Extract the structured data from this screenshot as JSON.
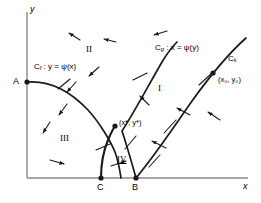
{
  "figure": {
    "background_color": "#ffffff",
    "stroke_color": "#1a1a1a",
    "axis_color": "#808080"
  },
  "axes": {
    "x_label": "x",
    "y_label": "y",
    "origin": {
      "x": 27,
      "y": 178
    },
    "x_end": {
      "x": 248,
      "y": 178
    },
    "y_top": {
      "x": 27,
      "y": 12
    }
  },
  "points": [
    {
      "name": "A",
      "label": "A",
      "x": 27,
      "y": 82,
      "label_x": 13,
      "label_y": 77,
      "filled": true
    },
    {
      "name": "C",
      "label": "C",
      "x": 101,
      "y": 178,
      "label_x": 97,
      "label_y": 183,
      "filled": true
    },
    {
      "name": "B",
      "label": "B",
      "x": 136,
      "y": 178,
      "label_x": 132,
      "label_y": 183,
      "filled": true
    },
    {
      "name": "x0y0",
      "label": "(x₀, y₀)",
      "x": 213,
      "y": 73,
      "label_x": 218,
      "label_y": 76,
      "filled": true
    },
    {
      "name": "xstar-ystar",
      "label": "(x*, y*)",
      "x": 115,
      "y": 126,
      "label_x": 119,
      "label_y": 119,
      "filled": true
    }
  ],
  "curves": [
    {
      "name": "curve-cf",
      "id": "Cf",
      "label_prefix": "C",
      "label_subscript": "f",
      "label_rest": " : y = ψ(x)",
      "label_full": "Cᶠ : y = ψ(x)",
      "label_x": 34,
      "label_y": 63,
      "path": "M 27 82 C 52 80 72 93 88 110 C 99 122 110 140 115 152 C 119 163 120 172 121 178"
    },
    {
      "name": "curve-cg",
      "id": "Cg",
      "label_prefix": "C",
      "label_subscript": "g",
      "label_rest": " : x = ψ(y)",
      "label_full": "Cᵍ : x = ψ(y)",
      "label_x": 155,
      "label_y": 44,
      "path": "M 136 178 C 131 160 126 143 122 131 C 132 116 147 88 162 62 C 168 52 173 46 177 42"
    },
    {
      "name": "curve-ck",
      "id": "Ck",
      "label_prefix": "C",
      "label_subscript": "k",
      "label_rest": "",
      "label_full": "Cᵏ",
      "label_x": 228,
      "label_y": 55,
      "path": "M 136 178 C 153 158 172 130 192 101 C 210 76 228 54 246 38"
    }
  ],
  "segment_cb": {
    "name": "segment-c-to-branch",
    "path": "M 101 178 C 101 168 103 152 108 140 C 111 133 113 129 115 126"
  },
  "regions": [
    {
      "name": "region-one",
      "label": "I",
      "x": 158,
      "y": 84,
      "underlined": false
    },
    {
      "name": "region-two",
      "label": "II",
      "x": 86,
      "y": 45,
      "underlined": false
    },
    {
      "name": "region-three",
      "label": "III",
      "x": 60,
      "y": 134,
      "underlined": false
    },
    {
      "name": "region-four",
      "label": "IV",
      "x": 117,
      "y": 155,
      "underlined": true
    }
  ],
  "field_arrows": [
    {
      "name": "arrow-field",
      "x1": 80,
      "y1": 40,
      "x2": 69,
      "y2": 33
    },
    {
      "name": "arrow-field",
      "x1": 116,
      "y1": 42,
      "x2": 104,
      "y2": 39
    },
    {
      "name": "arrow-field",
      "x1": 167,
      "y1": 31,
      "x2": 154,
      "y2": 35
    },
    {
      "name": "arrow-field",
      "x1": 99,
      "y1": 67,
      "x2": 89,
      "y2": 76
    },
    {
      "name": "arrow-field",
      "x1": 76,
      "y1": 82,
      "x2": 67,
      "y2": 92
    },
    {
      "name": "arrow-field",
      "x1": 67,
      "y1": 104,
      "x2": 59,
      "y2": 115
    },
    {
      "name": "arrow-field",
      "x1": 50,
      "y1": 122,
      "x2": 43,
      "y2": 133
    },
    {
      "name": "arrow-field",
      "x1": 50,
      "y1": 160,
      "x2": 64,
      "y2": 164
    },
    {
      "name": "arrow-field",
      "x1": 111,
      "y1": 166,
      "x2": 126,
      "y2": 161
    },
    {
      "name": "arrow-field",
      "x1": 149,
      "y1": 105,
      "x2": 140,
      "y2": 96
    },
    {
      "name": "arrow-field",
      "x1": 190,
      "y1": 115,
      "x2": 177,
      "y2": 108
    },
    {
      "name": "arrow-field",
      "x1": 166,
      "y1": 148,
      "x2": 152,
      "y2": 141
    },
    {
      "name": "arrow-field",
      "x1": 220,
      "y1": 120,
      "x2": 208,
      "y2": 112
    }
  ],
  "flow_ticks": [
    {
      "name": "tick-on-curve",
      "x1": 58,
      "y1": 89,
      "x2": 70,
      "y2": 79
    },
    {
      "name": "tick-on-curve",
      "x1": 96,
      "y1": 150,
      "x2": 110,
      "y2": 144
    },
    {
      "name": "tick-on-curve",
      "x1": 125,
      "y1": 149,
      "x2": 136,
      "y2": 136
    },
    {
      "name": "tick-on-curve",
      "x1": 133,
      "y1": 80,
      "x2": 147,
      "y2": 73
    },
    {
      "name": "tick-on-curve",
      "x1": 149,
      "y1": 167,
      "x2": 160,
      "y2": 155
    },
    {
      "name": "tick-on-curve",
      "x1": 164,
      "y1": 133,
      "x2": 176,
      "y2": 120
    },
    {
      "name": "tick-on-curve",
      "x1": 199,
      "y1": 85,
      "x2": 212,
      "y2": 73
    }
  ]
}
